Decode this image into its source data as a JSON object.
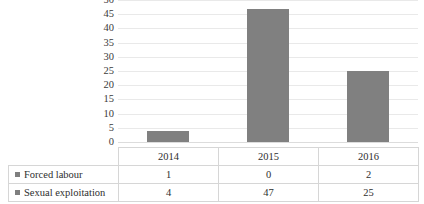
{
  "chart_data": {
    "type": "bar",
    "title": "",
    "subtitle": "",
    "xlabel": "",
    "ylabel": "",
    "categories": [
      "2014",
      "2015",
      "2016"
    ],
    "series": [
      {
        "name": "Forced labour",
        "values": [
          1,
          0,
          2
        ],
        "color": "#7f7f7f"
      },
      {
        "name": "Sexual exploitation",
        "values": [
          4,
          47,
          25
        ],
        "color": "#808080"
      }
    ],
    "ylim": [
      0,
      50
    ],
    "ytick_step": 5,
    "yticks": [
      50,
      45,
      40,
      35,
      30,
      25,
      20,
      15,
      10,
      5,
      0
    ],
    "ytick_labels": [
      "50",
      "45",
      "40",
      "35",
      "30",
      "25",
      "20",
      "15",
      "10",
      "5",
      "0"
    ],
    "grid": true,
    "grid_axis": "y",
    "legend": "data-table",
    "plotted_series": "Sexual exploitation"
  },
  "data_table": {
    "header": {
      "corner": "",
      "columns": [
        "2014",
        "2015",
        "2016"
      ]
    },
    "rows": [
      {
        "label": "Forced labour",
        "marker": "legend-swatch",
        "values": [
          "1",
          "0",
          "2"
        ]
      },
      {
        "label": "Sexual exploitation",
        "marker": "legend-swatch",
        "values": [
          "4",
          "47",
          "25"
        ]
      }
    ]
  },
  "colors": {
    "bar_fill": "#808080",
    "gridline": "#e9e9e9",
    "axis_line": "#dcdcdc",
    "table_border": "#d6d6d6",
    "text": "#2e2e2e",
    "tick_text": "#3b3b3b",
    "background": "#ffffff"
  }
}
